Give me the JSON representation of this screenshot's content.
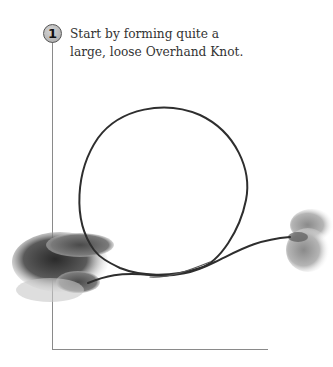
{
  "step": {
    "number": "1",
    "instruction_line1": "Start by forming quite a",
    "instruction_line2": "large, loose Overhand Knot."
  },
  "illustration": {
    "description": "Two hands holding a cord formed into a large loose overhand knot loop",
    "cord_color": "#2e2e2e",
    "hand_color": "#6a6a6a"
  },
  "colors": {
    "frame_line": "#8a8a8a",
    "badge_fill": "#b8b8b8",
    "text": "#333333"
  }
}
